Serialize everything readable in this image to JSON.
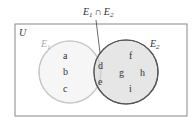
{
  "diagram": {
    "type": "venn",
    "universe_label": "U",
    "intersection_label": {
      "main": "E",
      "sub1": "1",
      "op": "∩",
      "main2": "E",
      "sub2": "2"
    },
    "sets": [
      {
        "name": "E",
        "sub": "1",
        "elements_only": [
          "a",
          "b",
          "c"
        ],
        "stroke": "#c8c8c8",
        "fill": "#f6f6f6"
      },
      {
        "name": "E",
        "sub": "2",
        "elements_only": [
          "f",
          "g",
          "h",
          "i"
        ],
        "stroke": "#555555",
        "fill": "#e6e6e6"
      }
    ],
    "intersection_elements": [
      "d",
      "e"
    ],
    "colors": {
      "border": "#888888",
      "text": "#333333",
      "e1_label": "#aaaaaa"
    }
  }
}
